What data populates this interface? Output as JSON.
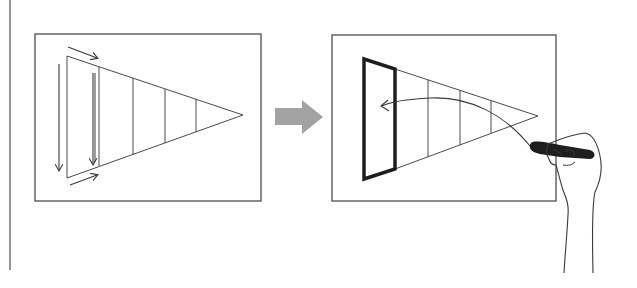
{
  "diagram": {
    "colors": {
      "background": "#ffffff",
      "stroke": "#4a4a4a",
      "thick_stroke": "#222222",
      "transition_arrow": "#a0a0a0",
      "marker": "#1e1e1e"
    },
    "left_panel": {
      "label": "before",
      "wedge_segments": 5,
      "scan_arrows": [
        "top-right",
        "left-down",
        "inner-down",
        "bottom-right"
      ]
    },
    "transition_arrow": {
      "direction": "right"
    },
    "right_panel": {
      "label": "after",
      "wedge_segments": 5,
      "highlighted_segment": 1,
      "curved_arrow": "points-left-to-highlighted-segment",
      "hand": "holding-marker"
    }
  }
}
